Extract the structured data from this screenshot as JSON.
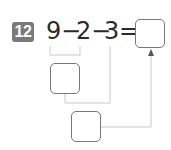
{
  "problem": {
    "number": "12",
    "expression": {
      "a": "9",
      "op1": "−",
      "b": "2",
      "op2": "−",
      "c": "3",
      "eq": "="
    },
    "answer_box": "",
    "step1_box": "",
    "step2_box": ""
  },
  "colors": {
    "badge": "#7a7a7a",
    "text": "#2b2b2b",
    "lines": "#c8c8c8",
    "box_border": "#777777"
  }
}
